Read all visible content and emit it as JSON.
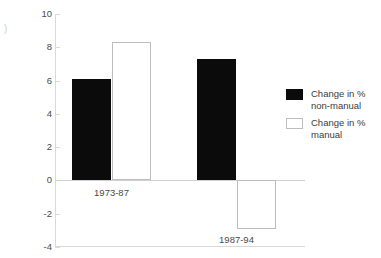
{
  "chart_data": {
    "type": "bar",
    "title": "",
    "subtitle": "",
    "xlabel": "",
    "ylabel": "",
    "categories": [
      "1973-87",
      "1987-94"
    ],
    "series": [
      {
        "name": "Change in %\nnon-manual",
        "style": "solid",
        "values": [
          6.1,
          7.3
        ]
      },
      {
        "name": "Change in %\nmanual",
        "style": "hollow",
        "values": [
          8.3,
          -2.9
        ]
      }
    ],
    "ylim": [
      -4,
      10
    ],
    "yticks": [
      10,
      8,
      6,
      4,
      2,
      0,
      -2,
      -4
    ],
    "ytick_labels": [
      "10",
      "8",
      "6",
      "4",
      "2",
      "0",
      "-2",
      "-4"
    ],
    "grid": false,
    "zero_line": true,
    "legend_position": "right"
  },
  "legend": {
    "entries": [
      {
        "label": "Change in %\nnon-manual",
        "style": "solid"
      },
      {
        "label": "Change in %\nmanual",
        "style": "hollow"
      }
    ]
  },
  "artifacts": {
    "stray_glyph": ")"
  },
  "colors": {
    "solid_fill": "#0b0b0b",
    "hollow_fill": "#ffffff",
    "hollow_stroke": "#bdbdbd",
    "axis": "#d9d9d9",
    "text": "#3c3c3c",
    "background": "#ffffff"
  }
}
